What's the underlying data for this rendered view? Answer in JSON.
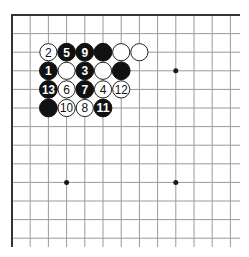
{
  "diagram": {
    "type": "go-board",
    "title": "",
    "colors": {
      "background": "#ffffff",
      "grid_line": "#9a9a9a",
      "border": "#333333",
      "black_stone": "#111111",
      "white_stone": "#ffffff",
      "stone_outline": "#222222",
      "star_point": "#1a1a1a"
    },
    "grid": {
      "origin_x": 12,
      "origin_y": 15,
      "spacing_x": 18.2,
      "spacing_y": 18.6,
      "visible_columns": 13,
      "visible_rows": 13,
      "end_x": 240,
      "end_y": 247,
      "edges": [
        "top",
        "left"
      ]
    },
    "star_points": [
      {
        "col": 3,
        "row": 3
      },
      {
        "col": 9,
        "row": 3
      },
      {
        "col": 3,
        "row": 9
      },
      {
        "col": 9,
        "row": 9
      }
    ],
    "stones": [
      {
        "col": 2,
        "row": 2,
        "color": "white",
        "label": "2"
      },
      {
        "col": 3,
        "row": 2,
        "color": "black",
        "label": "5"
      },
      {
        "col": 4,
        "row": 2,
        "color": "black",
        "label": "9"
      },
      {
        "col": 5,
        "row": 2,
        "color": "black",
        "label": ""
      },
      {
        "col": 6,
        "row": 2,
        "color": "white",
        "label": ""
      },
      {
        "col": 7,
        "row": 2,
        "color": "white",
        "label": ""
      },
      {
        "col": 2,
        "row": 3,
        "color": "black",
        "label": "1"
      },
      {
        "col": 3,
        "row": 3,
        "color": "white",
        "label": ""
      },
      {
        "col": 4,
        "row": 3,
        "color": "black",
        "label": "3"
      },
      {
        "col": 5,
        "row": 3,
        "color": "white",
        "label": ""
      },
      {
        "col": 6,
        "row": 3,
        "color": "black",
        "label": ""
      },
      {
        "col": 2,
        "row": 4,
        "color": "black",
        "label": "13"
      },
      {
        "col": 3,
        "row": 4,
        "color": "white",
        "label": "6"
      },
      {
        "col": 4,
        "row": 4,
        "color": "black",
        "label": "7"
      },
      {
        "col": 5,
        "row": 4,
        "color": "white",
        "label": "4"
      },
      {
        "col": 6,
        "row": 4,
        "color": "white",
        "label": "12"
      },
      {
        "col": 2,
        "row": 5,
        "color": "black",
        "label": ""
      },
      {
        "col": 3,
        "row": 5,
        "color": "white",
        "label": "10"
      },
      {
        "col": 4,
        "row": 5,
        "color": "white",
        "label": "8"
      },
      {
        "col": 5,
        "row": 5,
        "color": "black",
        "label": "11"
      }
    ]
  }
}
